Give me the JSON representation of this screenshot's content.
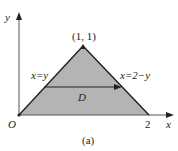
{
  "figure": {
    "axis_x_label": "x",
    "axis_y_label": "y",
    "origin_label": "O",
    "apex_label": "(1, 1)",
    "x_tick_label": "2",
    "left_edge_label": "x=y",
    "right_edge_label": "x=2−y",
    "region_label": "D",
    "caption": "(a)",
    "colors": {
      "fill": "#b4b4b4",
      "line": "#1a1a1a",
      "axis": "#555555"
    }
  }
}
